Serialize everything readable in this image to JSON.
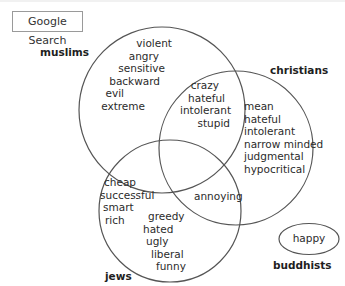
{
  "search_button": {
    "label": "Google Search"
  },
  "diagram": {
    "type": "venn",
    "line_color": "#555555",
    "sets": [
      {
        "id": "muslims",
        "label": "muslims"
      },
      {
        "id": "christians",
        "label": "christians"
      },
      {
        "id": "jews",
        "label": "jews"
      },
      {
        "id": "buddhists",
        "label": "buddhists"
      }
    ],
    "regions": {
      "muslims_only": [
        "violent",
        "angry",
        "sensitive",
        "backward",
        "evil",
        "extreme"
      ],
      "muslims_christians": [
        "crazy",
        "hateful",
        "intolerant",
        "stupid"
      ],
      "christians_only": [
        "mean",
        "hateful",
        "intolerant",
        "narrow minded",
        "judgmental",
        "hypocritical"
      ],
      "jews_only_left": [
        "cheap",
        "successful",
        "smart",
        "rich"
      ],
      "jews_only_right": [
        "greedy",
        "hated",
        "ugly",
        "liberal",
        "funny"
      ],
      "christians_jews": [
        "annoying"
      ],
      "buddhists_only": [
        "happy"
      ]
    }
  }
}
